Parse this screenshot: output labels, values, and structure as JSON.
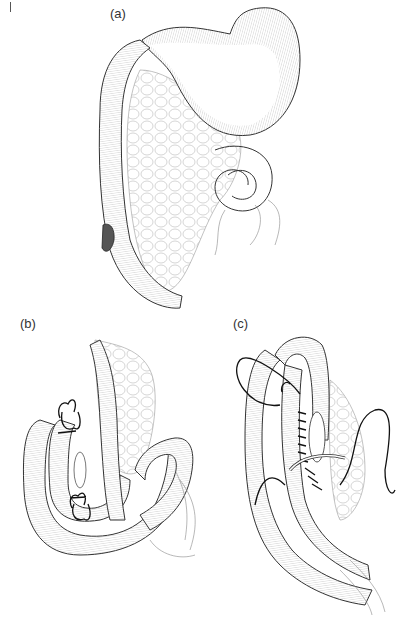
{
  "figure": {
    "page_mark": "|",
    "panels": [
      {
        "id": "a",
        "label": "(a)",
        "description": "Stomach with duodenum/colon segment and omentum, perforation site on bowel"
      },
      {
        "id": "b",
        "label": "(b)",
        "description": "Bowel loops aligned with stay sutures placed"
      },
      {
        "id": "c",
        "label": "(c)",
        "description": "Side-to-side anastomosis with continuous suture"
      }
    ]
  }
}
